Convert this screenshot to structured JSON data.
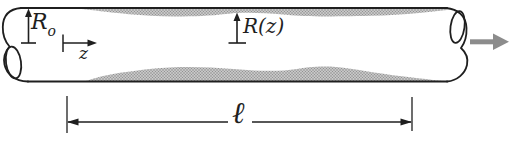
{
  "figure": {
    "labels": {
      "inlet_radius_symbol": "R",
      "inlet_radius_subscript": "o",
      "axial_coordinate": "z",
      "local_radius": "R(z)",
      "tube_length": "ℓ"
    },
    "colors": {
      "line": "#1f1f1f",
      "deposit_fill": "#c7c7c7",
      "deposit_dot": "#8e8e8e",
      "flow_arrow": "#8c8c8c",
      "background": "#ffffff"
    }
  }
}
